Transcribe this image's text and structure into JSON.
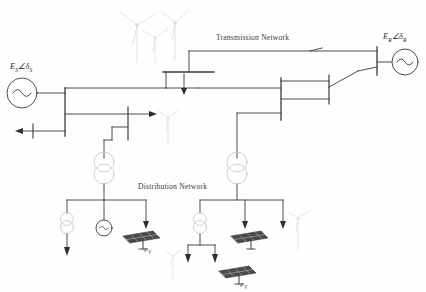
{
  "figure": {
    "type": "single-line-power-system-diagram",
    "background": "#fefefe",
    "line_color": "#3b3b3b",
    "faint_color": "#d8d8d8",
    "panel_color": "#4a4a4a"
  },
  "labels": {
    "transmission_network": "Transmission Network",
    "distribution_network": "Distribution Network",
    "source_left": "E",
    "source_left_sub1": "S",
    "source_left_angle": "∠δ",
    "source_left_sub2": "S",
    "source_right": "E",
    "source_right_sub1": "R",
    "source_right_angle": "∠δ",
    "source_right_sub2": "R",
    "pv_label_1": "P",
    "pv_label_1_sub": "V",
    "pv_label_2": "P",
    "pv_label_2_sub": "V",
    "caption": ""
  },
  "components": {
    "generators": [
      {
        "name": "generator-left",
        "label": "E_S∠δ_S",
        "cx": 22,
        "cy": 93,
        "r": 15
      },
      {
        "name": "generator-right",
        "label": "E_R∠δ_R",
        "cx": 406,
        "cy": 62,
        "r": 13
      },
      {
        "name": "generator-distribution-left",
        "cx": 104,
        "cy": 228,
        "r": 8
      }
    ],
    "transformers": [
      {
        "name": "transformer-distribution-left",
        "cx": 104,
        "cy": 168,
        "r": 10,
        "windings": 2
      },
      {
        "name": "transformer-distribution-right",
        "cx": 237,
        "cy": 168,
        "r": 10,
        "windings": 2
      },
      {
        "name": "transformer-feeder-left",
        "cx": 67,
        "cy": 222,
        "r": 6.5,
        "windings": 2
      },
      {
        "name": "transformer-feeder-right",
        "cx": 200,
        "cy": 222,
        "r": 6.5,
        "windings": 2
      }
    ],
    "buses": [
      {
        "name": "bus-left-main",
        "x": 65,
        "y1": 88,
        "y2": 130,
        "orientation": "vertical"
      },
      {
        "name": "bus-mid-upper",
        "x1": 163,
        "x2": 214,
        "y": 72,
        "orientation": "horizontal"
      },
      {
        "name": "bus-right-transmission",
        "x": 377,
        "y1": 47,
        "y2": 75,
        "orientation": "vertical"
      },
      {
        "name": "bus-tap-left",
        "x": 128,
        "y1": 112,
        "y2": 140,
        "orientation": "vertical"
      },
      {
        "name": "bus-right-lower",
        "x": 281,
        "y1": 78,
        "y2": 120,
        "orientation": "vertical"
      }
    ],
    "loads": [
      {
        "name": "load-arrow-left-out",
        "direction": "left",
        "x": 14,
        "y": 130
      },
      {
        "name": "load-arrow-mid-right",
        "direction": "right",
        "x": 152,
        "y": 117
      },
      {
        "name": "load-arrow-transmission-tap",
        "direction": "down",
        "x": 184,
        "y": 92
      },
      {
        "name": "load-arrow-dist-left-1",
        "direction": "down",
        "x": 67,
        "y": 255
      },
      {
        "name": "load-arrow-dist-left-2",
        "direction": "down",
        "x": 146,
        "y": 228
      },
      {
        "name": "load-arrow-dist-right-1",
        "direction": "down",
        "x": 188,
        "y": 262
      },
      {
        "name": "load-arrow-dist-right-2",
        "direction": "down",
        "x": 215,
        "y": 262
      },
      {
        "name": "load-arrow-dist-right-3",
        "direction": "down",
        "x": 245,
        "y": 228
      },
      {
        "name": "load-arrow-dist-right-4",
        "direction": "down",
        "x": 283,
        "y": 228
      }
    ],
    "wind_turbines": [
      {
        "name": "wind-turbine-top-1",
        "x": 134,
        "y": 8,
        "scale": 1.0
      },
      {
        "name": "wind-turbine-top-2",
        "x": 156,
        "y": 18,
        "scale": 0.85
      },
      {
        "name": "wind-turbine-top-3",
        "x": 175,
        "y": 6,
        "scale": 0.9
      },
      {
        "name": "wind-turbine-mid",
        "x": 167,
        "y": 112,
        "scale": 0.7
      },
      {
        "name": "wind-turbine-right-low",
        "x": 297,
        "y": 208,
        "scale": 0.7
      },
      {
        "name": "wind-turbine-bottom",
        "x": 172,
        "y": 248,
        "scale": 0.55
      }
    ],
    "solar_panels": [
      {
        "name": "solar-panel-left",
        "x": 132,
        "y": 232,
        "scale": 1.0
      },
      {
        "name": "solar-panel-right-1",
        "x": 240,
        "y": 232,
        "scale": 1.0
      },
      {
        "name": "solar-panel-right-2",
        "x": 228,
        "y": 268,
        "scale": 1.0
      }
    ]
  }
}
